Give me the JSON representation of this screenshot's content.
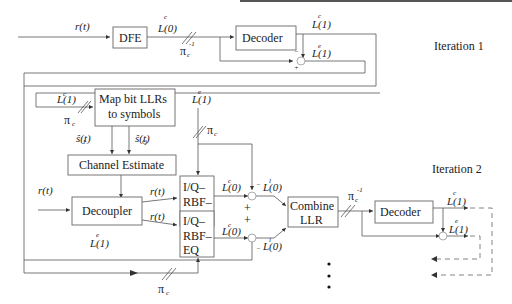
{
  "iterations": [
    {
      "label": "Iteration 1"
    },
    {
      "label": "Iteration 2"
    }
  ],
  "iteration1": {
    "input_signal": "r(t)",
    "dfe_label": "DFE",
    "dfe_output": "L(0)",
    "deinterleaver": "π",
    "decoder_label": "Decoder",
    "decoder_output_c": "L(1)",
    "decoder_output_e": "L(1)"
  },
  "iteration2": {
    "feedback_llr": "L(1)",
    "interleaver_left": "π",
    "map_block_line1": "Map bit LLRs",
    "map_block_line2": "to symbols",
    "s_i": "ŝ(t)",
    "s_q": "ŝ(t)",
    "extrinsic_top": "L(1)",
    "interleaver_top": "π",
    "channel_estimate_label": "Channel Estimate",
    "input_signal": "r(t)",
    "decoupler_label": "Decoupler",
    "ri": "r(t)",
    "rq": "r(t)",
    "decoupler_extrinsic": "L(1)",
    "eq_top_lines": [
      "I/Q–",
      "RBF–",
      "EQ"
    ],
    "eq_bottom_lines": [
      "I/Q–",
      "RBF–",
      "EQ"
    ],
    "eq_top_out": "L(0)",
    "eq_bottom_out": "L(0)",
    "minus_top": "L(0)",
    "minus_bottom": "L(0)",
    "plus_signs": [
      "+",
      "+"
    ],
    "combine_line1": "Combine",
    "combine_line2": "LLR",
    "deinterleaver": "π",
    "decoder_label": "Decoder",
    "decoder_output_c": "L(1)",
    "decoder_output_e": "L(1)",
    "interleaver_bottom": "π"
  },
  "continuation": "⋮"
}
